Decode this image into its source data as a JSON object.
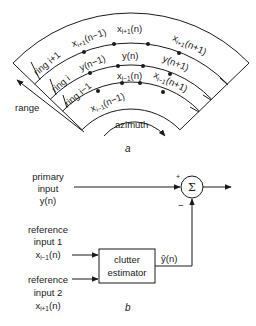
{
  "panel_a": {
    "caption": "a",
    "rings": [
      {
        "label": "ring i+1"
      },
      {
        "label": "ring i"
      },
      {
        "label": "ring i−1"
      }
    ],
    "cells": {
      "ring_ip1": {
        "left": "x",
        "left_sub": "i+1",
        "left_arg": "(n−1)",
        "mid": "x",
        "mid_sub": "i+1",
        "mid_arg": "(n)",
        "right": "x",
        "right_sub": "i+1",
        "right_arg": "(n+1)"
      },
      "ring_i": {
        "left": "y(n−1)",
        "mid": "y(n)",
        "right": "y(n+1)"
      },
      "ring_im1": {
        "left": "x",
        "left_sub": "i−1",
        "left_arg": "(n−1)",
        "mid": "x",
        "mid_sub": "i−1",
        "mid_arg": "(n)",
        "right": "x",
        "right_sub": "i−1",
        "right_arg": "(n+1)"
      }
    },
    "axes": {
      "range": "range",
      "azimuth": "azimuth"
    }
  },
  "panel_b": {
    "caption": "b",
    "primary_input": {
      "line1": "primary",
      "line2": "input",
      "line3": "y(n)"
    },
    "reference_input_1": {
      "line1": "reference",
      "line2": "input 1",
      "sym": "x",
      "sub": "i−1",
      "arg": "(n)"
    },
    "reference_input_2": {
      "line1": "reference",
      "line2": "input 2",
      "sym": "x",
      "sub": "i+1",
      "arg": "(n)"
    },
    "estimator": {
      "line1": "clutter",
      "line2": "estimator"
    },
    "estimate_label": "ŷ(n)",
    "summer": {
      "symbol": "Σ",
      "plus": "+",
      "minus": "−"
    }
  }
}
